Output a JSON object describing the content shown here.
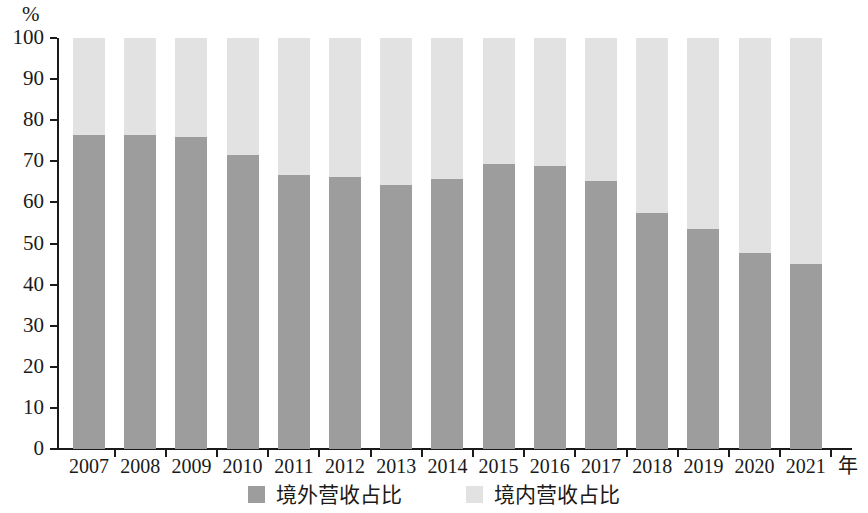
{
  "chart_data": {
    "type": "bar",
    "subtype": "stacked-100-percent",
    "title": "",
    "xlabel": "年",
    "ylabel": "%",
    "ylim": [
      0,
      100
    ],
    "yticks": [
      0,
      10,
      20,
      30,
      40,
      50,
      60,
      70,
      80,
      90,
      100
    ],
    "grid": false,
    "legend_position": "bottom-center",
    "categories": [
      "2007",
      "2008",
      "2009",
      "2010",
      "2011",
      "2012",
      "2013",
      "2014",
      "2015",
      "2016",
      "2017",
      "2018",
      "2019",
      "2020",
      "2021"
    ],
    "series": [
      {
        "name": "境外营收占比",
        "color": "#9d9d9d",
        "values": [
          76.3,
          76.3,
          75.8,
          71.5,
          66.6,
          66.3,
          64.3,
          65.6,
          69.3,
          68.8,
          65.1,
          57.5,
          53.6,
          47.8,
          44.9
        ]
      },
      {
        "name": "境内营收占比",
        "color": "#e2e2e2",
        "values": [
          23.7,
          23.7,
          24.2,
          28.5,
          33.4,
          33.7,
          35.7,
          34.4,
          30.7,
          31.2,
          34.9,
          42.5,
          46.4,
          52.2,
          55.1
        ]
      }
    ]
  },
  "axes": {
    "y_unit": "%",
    "x_unit": "年"
  },
  "legend": [
    {
      "label": "境外营收占比",
      "color": "#9d9d9d"
    },
    {
      "label": "境内营收占比",
      "color": "#e2e2e2"
    }
  ]
}
